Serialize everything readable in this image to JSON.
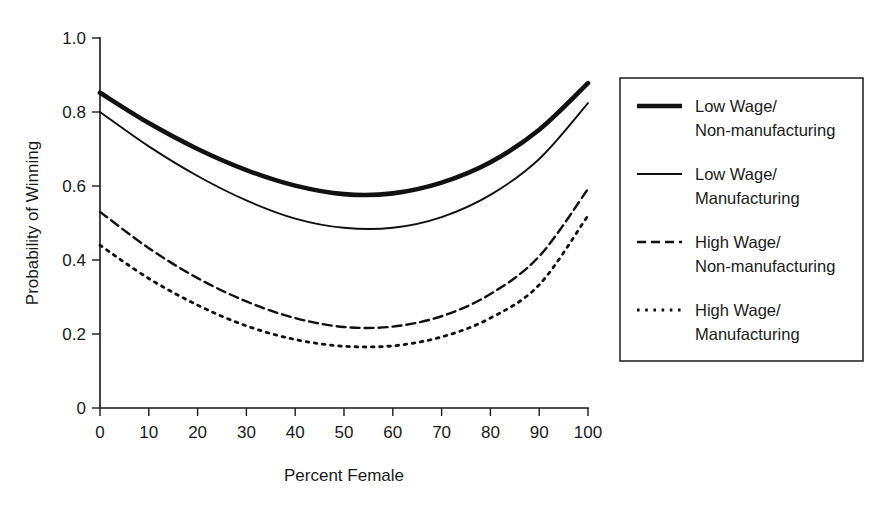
{
  "chart_data": {
    "type": "line",
    "title": "",
    "xlabel": "Percent Female",
    "ylabel": "Probability of Winning",
    "xlim": [
      0,
      100
    ],
    "ylim": [
      0,
      1.0
    ],
    "grid": false,
    "legend_position": "right",
    "xticks": [
      0,
      10,
      20,
      30,
      40,
      50,
      60,
      70,
      80,
      90,
      100
    ],
    "xtick_labels": [
      "0",
      "10",
      "20",
      "30",
      "40",
      "50",
      "60",
      "70",
      "80",
      "90",
      "100"
    ],
    "yticks": [
      0,
      0.2,
      0.4,
      0.6,
      0.8,
      1.0
    ],
    "ytick_labels": [
      "0",
      "0.2",
      "0.4",
      "0.6",
      "0.8",
      "1.0"
    ],
    "x": [
      0,
      10,
      20,
      30,
      40,
      50,
      60,
      70,
      80,
      90,
      100
    ],
    "series": [
      {
        "name": "Low Wage/Non-manufacturing",
        "label_line1": "Low Wage/",
        "label_line2": "Non-manufacturing",
        "style": "thick-solid",
        "dash": "none",
        "width": 4.6,
        "color": "#111111",
        "values": [
          0.852,
          0.77,
          0.7,
          0.643,
          0.601,
          0.578,
          0.58,
          0.609,
          0.664,
          0.752,
          0.878
        ]
      },
      {
        "name": "Low Wage/Manufacturing",
        "label_line1": "Low Wage/",
        "label_line2": "Manufacturing",
        "style": "thin-solid",
        "dash": "none",
        "width": 1.9,
        "color": "#111111",
        "values": [
          0.8,
          0.707,
          0.627,
          0.561,
          0.512,
          0.487,
          0.487,
          0.516,
          0.576,
          0.673,
          0.824
        ]
      },
      {
        "name": "High Wage/Non-manufacturing",
        "label_line1": "High Wage/",
        "label_line2": "Non-manufacturing",
        "style": "dashed",
        "dash": "9,5",
        "width": 2.4,
        "color": "#111111",
        "values": [
          0.53,
          0.432,
          0.351,
          0.288,
          0.243,
          0.219,
          0.22,
          0.248,
          0.308,
          0.41,
          0.592
        ]
      },
      {
        "name": "High Wage/Manufacturing",
        "label_line1": "High Wage/",
        "label_line2": "Manufacturing",
        "style": "dotted",
        "dash": "2.6,5.6",
        "width": 2.8,
        "color": "#111111",
        "values": [
          0.44,
          0.35,
          0.278,
          0.222,
          0.185,
          0.167,
          0.168,
          0.192,
          0.243,
          0.333,
          0.52
        ]
      }
    ]
  },
  "axis": {
    "y_title": "Probability of Winning",
    "x_title": "Percent Female"
  },
  "legend": {
    "items": [
      {
        "line1": "Low Wage/",
        "line2": "Non-manufacturing"
      },
      {
        "line1": "Low Wage/",
        "line2": "Manufacturing"
      },
      {
        "line1": "High Wage/",
        "line2": "Non-manufacturing"
      },
      {
        "line1": "High Wage/",
        "line2": "Manufacturing"
      }
    ]
  },
  "colors": {
    "ink": "#111111",
    "axis": "#1a1a1a",
    "background": "#ffffff"
  }
}
